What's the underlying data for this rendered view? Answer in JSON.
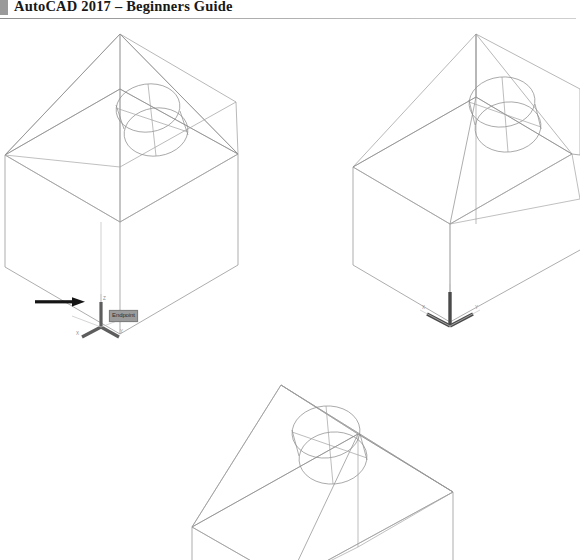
{
  "page": {
    "header": {
      "title": "AutoCAD 2017 – Beginners Guide",
      "marker_color": "#9a9a9a",
      "rule_color": "#a8a8a8"
    },
    "background_color": "#ffffff",
    "line_color": "#7d7d7d"
  },
  "annotations": {
    "arrow": {
      "name": "pointer-arrow",
      "color": "#151515",
      "direction": "right"
    },
    "tooltip": {
      "label": "Endpoint",
      "background_color": "#9b9b9b",
      "text_color": "#2b2b2b",
      "border_color": "#7e7e7e"
    }
  },
  "figures": [
    {
      "id": "figure-1",
      "name": "isometric-house-with-cylinder-ucs-endpoint",
      "caption": "",
      "ucs_icon": {
        "style": "3-axis",
        "color": "#5d5d5d",
        "labels": {
          "x": "X",
          "y": "Y",
          "z": "Z"
        }
      }
    },
    {
      "id": "figure-2",
      "name": "isometric-house-with-cylinder-ucs-xy",
      "caption": "",
      "ucs_icon": {
        "style": "xy-vee",
        "color": "#4a4a4a",
        "labels": {
          "x": "X",
          "y": "Y"
        }
      }
    },
    {
      "id": "figure-3",
      "name": "isometric-house-with-cylinder-cropped",
      "caption": "",
      "ucs_icon": null
    }
  ]
}
